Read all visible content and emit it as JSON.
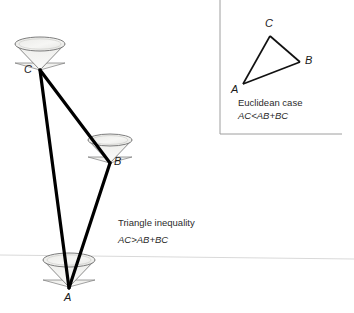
{
  "figure": {
    "title_main": "Triangle inequality",
    "formula_main": "AC>AB+BC",
    "title_inset": "Euclidean case",
    "formula_inset": "AC<AB+BC",
    "colors": {
      "line": "#000000",
      "cone_stroke": "#6e6e6e",
      "cone_fill": "#f2f2f0",
      "horizon": "#d8d8d8",
      "inset_border": "#9a9a9a",
      "text": "#2b2b2b"
    },
    "main_diagram": {
      "vertices": [
        {
          "label": "C",
          "x": 40,
          "y": 70
        },
        {
          "label": "B",
          "x": 110,
          "y": 163
        },
        {
          "label": "A",
          "x": 69,
          "y": 287
        }
      ],
      "vertex_labels": [
        {
          "label": "C",
          "x": 26,
          "y": 66
        },
        {
          "label": "B",
          "x": 115,
          "y": 157
        },
        {
          "label": "A",
          "x": 64,
          "y": 290
        }
      ],
      "edges": [
        {
          "name": "CA",
          "from": "C",
          "to": "A"
        },
        {
          "name": "CB",
          "from": "C",
          "to": "B"
        },
        {
          "name": "BA",
          "from": "B",
          "to": "A"
        }
      ],
      "cones": [
        {
          "at": "C",
          "cx": 40,
          "cy": 70,
          "rx": 25,
          "ry": 7,
          "depth": 26
        },
        {
          "at": "B",
          "cx": 110,
          "cy": 163,
          "rx": 22,
          "ry": 6,
          "depth": 23
        },
        {
          "at": "A",
          "cx": 69,
          "cy": 287,
          "rx": 26,
          "ry": 7,
          "depth": 28
        }
      ],
      "horizon": {
        "x1": 0,
        "y1": 255,
        "x2": 354,
        "y2": 259
      }
    },
    "inset_diagram": {
      "box": {
        "x": 220,
        "y": 0,
        "width": 122,
        "height": 135
      },
      "vertices": [
        {
          "label": "C",
          "x": 270,
          "y": 36
        },
        {
          "label": "B",
          "x": 300,
          "y": 62
        },
        {
          "label": "A",
          "x": 243,
          "y": 84
        }
      ],
      "vertex_labels": [
        {
          "label": "C",
          "x": 265,
          "y": 21
        },
        {
          "label": "B",
          "x": 306,
          "y": 57
        },
        {
          "label": "A",
          "x": 231,
          "y": 85
        }
      ],
      "edges": [
        {
          "name": "AC",
          "from": "A",
          "to": "C"
        },
        {
          "name": "CB",
          "from": "C",
          "to": "B"
        },
        {
          "name": "AB",
          "from": "A",
          "to": "B"
        }
      ]
    },
    "captions": {
      "main": {
        "x": 118,
        "y": 219
      },
      "inset": {
        "x": 238,
        "y": 98
      }
    }
  }
}
